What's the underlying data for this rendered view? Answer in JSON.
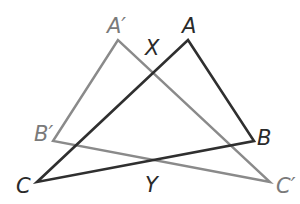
{
  "diagram": {
    "triangle_original": {
      "vertices": [
        "A",
        "B",
        "C"
      ],
      "color": "#2a2a2a"
    },
    "triangle_image": {
      "vertices": [
        "A′",
        "B′",
        "C′"
      ],
      "color": "#7a7a7a"
    },
    "labels": {
      "A": "A",
      "B": "B",
      "C": "C",
      "A_prime": "A′",
      "B_prime": "B′",
      "C_prime": "C′",
      "X": "X",
      "Y": "Y"
    }
  }
}
